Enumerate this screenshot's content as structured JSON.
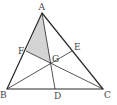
{
  "diagram": {
    "colors": {
      "stroke": "#2a2a2a",
      "shade": "#d4d4d4",
      "label": "#444444"
    },
    "points": {
      "A": {
        "label": "A",
        "x": 42,
        "y": 13
      },
      "B": {
        "label": "B",
        "x": 7,
        "y": 89
      },
      "C": {
        "label": "C",
        "x": 103,
        "y": 89
      },
      "D": {
        "label": "D",
        "x": 55,
        "y": 89
      },
      "E": {
        "label": "E",
        "x": 72,
        "y": 51
      },
      "F": {
        "label": "F",
        "x": 26,
        "y": 51
      },
      "G": {
        "label": "G",
        "x": 51,
        "y": 63
      }
    },
    "shaded_region": [
      "A",
      "F",
      "G"
    ]
  }
}
